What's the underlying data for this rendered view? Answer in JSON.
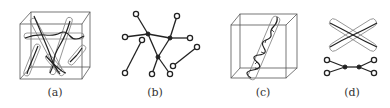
{
  "panels": [
    {
      "id": "a",
      "label": "(a)",
      "description": "Simulation box with several polymer chains enclosed in tubes"
    },
    {
      "id": "b",
      "label": "(b)",
      "description": "Network graph with open (end) and filled (junction) nodes"
    },
    {
      "id": "c",
      "label": "(c)",
      "description": "Simulation box with single chain inside a tube"
    },
    {
      "id": "d",
      "label": "(d)",
      "description": "Two crossing tubes and corresponding graph with two junctions"
    }
  ],
  "colors": {
    "line": "#222222",
    "box": "#555555",
    "tube": "#888888",
    "background": "#ffffff"
  }
}
